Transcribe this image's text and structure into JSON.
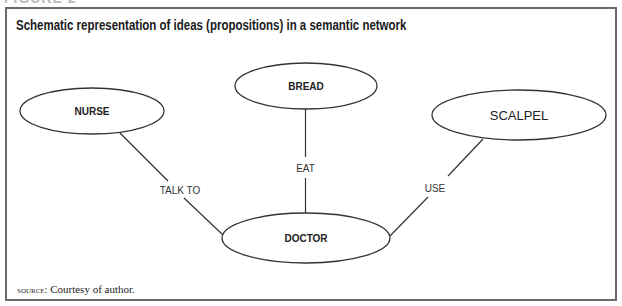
{
  "figure": {
    "label": "FIGURE 2",
    "title": "Schematic representation of ideas (propositions) in a semantic network",
    "source_label": "SOURCE:",
    "source_text": "Courtesy of author."
  },
  "nodes": [
    {
      "id": "nurse",
      "label": "NURSE",
      "cx": 92,
      "cy": 111,
      "rx": 72,
      "ry": 23,
      "style": "bold"
    },
    {
      "id": "bread",
      "label": "BREAD",
      "cx": 306,
      "cy": 86,
      "rx": 71,
      "ry": 23,
      "style": "bold"
    },
    {
      "id": "scalpel",
      "label": "SCALPEL",
      "cx": 519,
      "cy": 115,
      "rx": 87,
      "ry": 25,
      "style": "regular"
    },
    {
      "id": "doctor",
      "label": "DOCTOR",
      "cx": 306,
      "cy": 238,
      "rx": 84,
      "ry": 25,
      "style": "bold"
    }
  ],
  "edges": [
    {
      "from": "doctor",
      "to": "nurse",
      "label": "TALK TO"
    },
    {
      "from": "doctor",
      "to": "bread",
      "label": "EAT"
    },
    {
      "from": "doctor",
      "to": "scalpel",
      "label": "USE"
    }
  ],
  "colors": {
    "frame": "#6b6b6b",
    "stroke": "#333333",
    "text": "#1a1a1a"
  }
}
